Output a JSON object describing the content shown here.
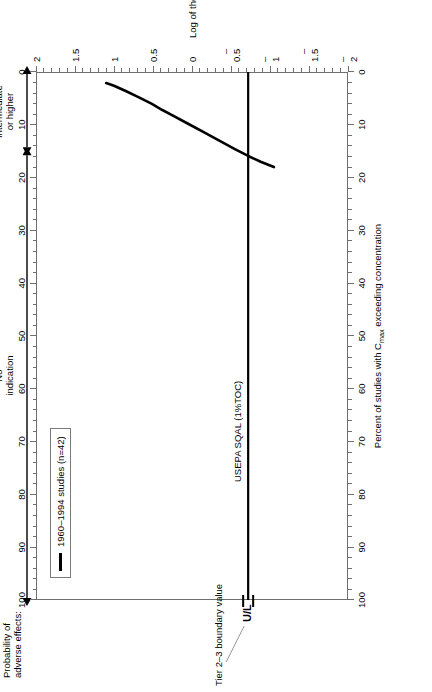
{
  "figure": {
    "probability_header": "Probability of\nadverse effects:",
    "band_left_label": "No\nindication",
    "band_right_label": "Intermediate\nor higher",
    "band_boundary_percent": 15,
    "annotation_tier": "Tier 2–3 boundary value",
    "annotation_ul": "U/L",
    "sqal_label": "USEPA SQAL  (1%TOC)"
  },
  "legend": {
    "entries": [
      {
        "label": "1960–1994 studies (n=42)",
        "color": "#000000"
      }
    ]
  },
  "chart_data": {
    "type": "line",
    "title": "",
    "xlabel": "Log of the diazinon concentration in sediment, in µg/kg",
    "ylabel": "Percent of studies with Cₘₐₓ exceeding concentration",
    "ylabel_parts": {
      "pre": "Percent of studies with C",
      "sub": "max",
      "post": " exceeding concentration"
    },
    "xlim": [
      -2,
      2
    ],
    "ylim": [
      0,
      100
    ],
    "xticks": [
      -2,
      -1.5,
      -1,
      -0.5,
      0,
      0.5,
      1,
      1.5,
      2
    ],
    "xtick_labels": [
      "–2",
      "–1.5",
      "–1",
      "–0.5",
      "0",
      "0.5",
      "1",
      "1.5",
      "2"
    ],
    "xminor_step": 0.1,
    "yticks": [
      0,
      10,
      20,
      30,
      40,
      50,
      60,
      70,
      80,
      90,
      100
    ],
    "ytick_labels": [
      "0",
      "10",
      "20",
      "30",
      "40",
      "50",
      "60",
      "70",
      "80",
      "90",
      "100"
    ],
    "yminor_step": 2,
    "grid": false,
    "legend_position": "top-left",
    "series": [
      {
        "name": "1960–1994 studies (n=42)",
        "color": "#000000",
        "x": [
          -1.05,
          -0.88,
          -0.72,
          -0.55,
          -0.35,
          -0.15,
          0.05,
          0.25,
          0.38,
          0.52,
          0.68,
          0.85,
          1.0,
          1.1
        ],
        "y": [
          18.0,
          17.0,
          15.9,
          14.6,
          13.0,
          11.4,
          9.8,
          8.2,
          7.2,
          6.0,
          4.8,
          3.6,
          2.6,
          2.1
        ]
      }
    ],
    "reference_lines": [
      {
        "name": "USEPA SQAL (1%TOC)",
        "orientation": "vertical",
        "x": -0.72,
        "label": "USEPA SQAL  (1%TOC)",
        "color": "#000000"
      }
    ],
    "markers": [
      {
        "name": "Tier 2–3 boundary value",
        "label": "U/L",
        "x": -0.72,
        "y": 100
      }
    ]
  }
}
